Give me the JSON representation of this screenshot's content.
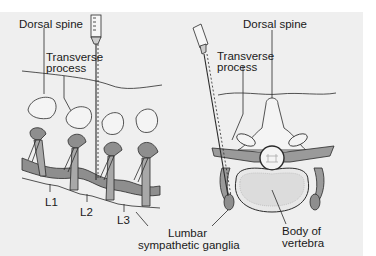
{
  "figure": {
    "left_view": {
      "title": "lateral-view",
      "labels": {
        "dorsal_spine": "Dorsal spine",
        "transverse_line1": "Transverse",
        "transverse_line2": "process",
        "l1": "L1",
        "l2": "L2",
        "l3": "L3"
      }
    },
    "right_view": {
      "title": "cross-section-view",
      "labels": {
        "dorsal_spine": "Dorsal spine",
        "transverse_line1": "Transverse",
        "transverse_line2": "process",
        "ganglia_line1": "Lumbar",
        "ganglia_line2": "sympathetic ganglia",
        "body_line1": "Body of",
        "body_line2": "vertebra"
      }
    },
    "colors": {
      "background": "#efefef",
      "outline": "#2a2a2a",
      "chain": "#8a8a8a",
      "bone": "#f4f4f4",
      "dark_tissue": "#9a9a9a"
    }
  }
}
